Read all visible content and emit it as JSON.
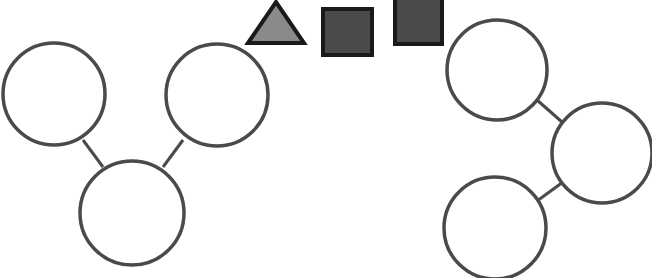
{
  "diagram": {
    "stroke_color": "#4a4a4a",
    "node_fill": "#ffffff",
    "shapes": {
      "triangle": {
        "fill": "#8a8a8a",
        "stroke": "#1a1a1a",
        "points": "248,43 276,2 304,43"
      },
      "square1": {
        "fill": "#4a4a4a",
        "stroke": "#1a1a1a",
        "x": 323,
        "y": 9,
        "w": 49,
        "h": 46
      },
      "square2": {
        "fill": "#4a4a4a",
        "stroke": "#1a1a1a",
        "x": 395,
        "y": -2,
        "w": 47,
        "h": 46
      }
    },
    "left_group": {
      "nodes": [
        {
          "id": "L-top-left",
          "cx": 54,
          "cy": 94,
          "r": 51
        },
        {
          "id": "L-top-right",
          "cx": 217,
          "cy": 95,
          "r": 51
        },
        {
          "id": "L-bottom",
          "cx": 132,
          "cy": 213,
          "r": 52
        }
      ],
      "edges": [
        {
          "from": "L-top-left",
          "to": "L-bottom",
          "x1": 83,
          "y1": 140,
          "x2": 103,
          "y2": 167
        },
        {
          "from": "L-top-right",
          "to": "L-bottom",
          "x1": 183,
          "y1": 140,
          "x2": 163,
          "y2": 167
        }
      ]
    },
    "right_group": {
      "nodes": [
        {
          "id": "R-top",
          "cx": 497,
          "cy": 70,
          "r": 50
        },
        {
          "id": "R-middle",
          "cx": 602,
          "cy": 153,
          "r": 50
        },
        {
          "id": "R-bottom",
          "cx": 495,
          "cy": 228,
          "r": 51
        }
      ],
      "edges": [
        {
          "from": "R-top",
          "to": "R-middle",
          "x1": 537,
          "y1": 100,
          "x2": 562,
          "y2": 122
        },
        {
          "from": "R-middle",
          "to": "R-bottom",
          "x1": 563,
          "y1": 182,
          "x2": 537,
          "y2": 201
        }
      ]
    }
  }
}
